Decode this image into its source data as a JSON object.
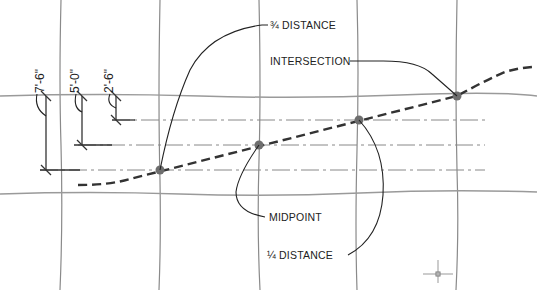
{
  "diagram": {
    "labels": {
      "three_quarter": "¾ DISTANCE",
      "intersection": "INTERSECTION",
      "midpoint": "MIDPOINT",
      "one_quarter": "¼ DISTANCE"
    },
    "dimensions": {
      "d1": "7'-6\"",
      "d2": "5'-0\"",
      "d3": "2'-6\""
    },
    "colors": {
      "grid": "#8a8a8a",
      "curve": "#333333",
      "points": "#6e6e6e"
    },
    "points": [
      {
        "name": "one-quarter-point",
        "x": 160,
        "y": 170
      },
      {
        "name": "midpoint",
        "x": 259,
        "y": 145
      },
      {
        "name": "three-quarter-point",
        "x": 359,
        "y": 120
      },
      {
        "name": "intersection-point",
        "x": 457,
        "y": 96
      }
    ]
  }
}
